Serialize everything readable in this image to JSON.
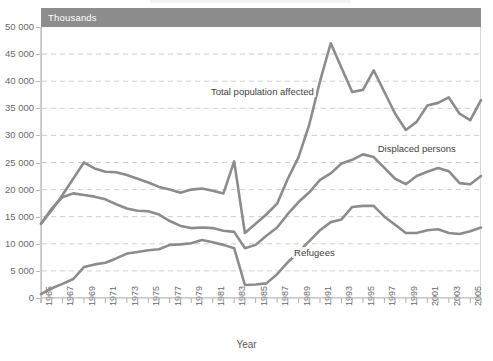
{
  "chart_header": {
    "unit_label": "Thousands"
  },
  "axes": {
    "x_title": "Year",
    "y_ticks": [
      "0",
      "5 000",
      "10 000",
      "15 000",
      "20 000",
      "25 000",
      "30 000",
      "35 000",
      "40 000",
      "45 000",
      "50 000"
    ],
    "x_ticks": [
      "1965",
      "1967",
      "1969",
      "1971",
      "1973",
      "1975",
      "1977",
      "1979",
      "1981",
      "1983",
      "1985",
      "1987",
      "1989",
      "1991",
      "1993",
      "1995",
      "1997",
      "1999",
      "2001",
      "2003",
      "2005"
    ]
  },
  "series_labels": {
    "total": "Total population affected",
    "displaced": "Displaced persons",
    "refugees": "Refugees"
  },
  "colors": {
    "line": "#8c8c8c",
    "header_bar": "#8d8d8d",
    "gridline": "#cfcfcf",
    "frame": "#d8d8d8",
    "tick_text": "#6a6a6a"
  },
  "chart_data": {
    "type": "line",
    "title": "",
    "subtitle": "",
    "unit": "Thousands",
    "xlabel": "Year",
    "ylabel": "",
    "ylim": [
      0,
      50000
    ],
    "ytick_step": 5000,
    "grid": true,
    "legend": "inline-annotations",
    "x": [
      1965,
      1966,
      1967,
      1968,
      1969,
      1970,
      1971,
      1972,
      1973,
      1974,
      1975,
      1976,
      1977,
      1978,
      1979,
      1980,
      1981,
      1982,
      1983,
      1984,
      1985,
      1986,
      1987,
      1988,
      1989,
      1990,
      1991,
      1992,
      1993,
      1994,
      1995,
      1996,
      1997,
      1998,
      1999,
      2000,
      2001,
      2002,
      2003,
      2004,
      2005,
      2006
    ],
    "series": [
      {
        "name": "Total population affected",
        "values": [
          13700,
          16200,
          19000,
          22000,
          25000,
          23900,
          23300,
          23200,
          22700,
          22000,
          21300,
          20500,
          20000,
          19400,
          20000,
          20200,
          19800,
          19300,
          25200,
          12000,
          13700,
          15400,
          17400,
          22000,
          26000,
          32000,
          40000,
          47000,
          42500,
          38000,
          38400,
          42000,
          38000,
          34000,
          31000,
          32500,
          35500,
          36000,
          37000,
          34000,
          32800,
          36500
        ]
      },
      {
        "name": "Displaced persons",
        "values": [
          13700,
          16500,
          18600,
          19300,
          19000,
          18700,
          18200,
          17300,
          16500,
          16100,
          16000,
          15400,
          14200,
          13300,
          12900,
          13000,
          12900,
          12400,
          12200,
          9200,
          9800,
          11500,
          13000,
          15500,
          17700,
          19500,
          21800,
          23000,
          24800,
          25500,
          26500,
          26000,
          24000,
          22000,
          21000,
          22500,
          23300,
          24000,
          23400,
          21200,
          21000,
          22500
        ]
      },
      {
        "name": "Refugees",
        "values": [
          700,
          1800,
          2600,
          3500,
          5700,
          6200,
          6500,
          7300,
          8200,
          8500,
          8800,
          9000,
          9800,
          9900,
          10100,
          10700,
          10300,
          9800,
          9200,
          2400,
          2500,
          2700,
          4400,
          6600,
          8500,
          10500,
          12500,
          14000,
          14500,
          16800,
          17000,
          17000,
          15000,
          13500,
          12000,
          12000,
          12500,
          12700,
          12000,
          11800,
          12300,
          13000
        ]
      }
    ]
  }
}
